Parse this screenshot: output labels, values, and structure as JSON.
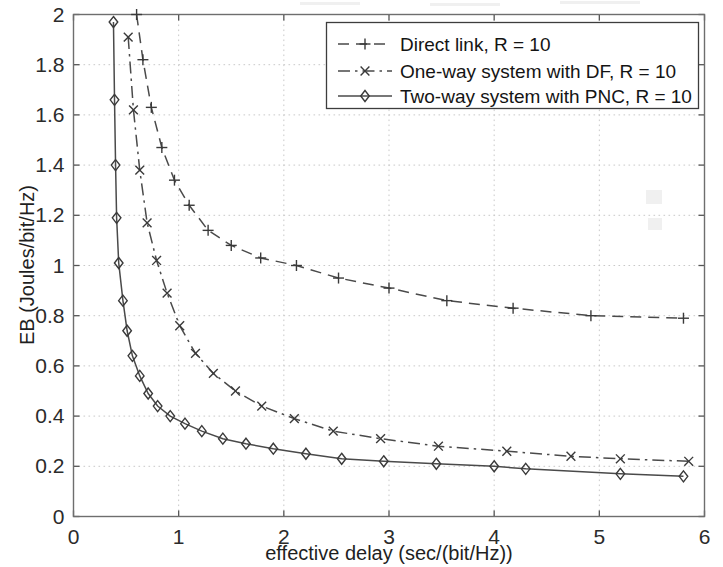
{
  "chart_data": {
    "type": "line",
    "title": "",
    "xlabel": "effective delay (sec/(bit/Hz))",
    "ylabel": "EB (Joules/bit/Hz)",
    "xlim": [
      0,
      6
    ],
    "ylim": [
      0,
      2
    ],
    "xticks": [
      "0",
      "1",
      "2",
      "3",
      "4",
      "5",
      "6"
    ],
    "yticks": [
      "0",
      "0.2",
      "0.4",
      "0.6",
      "0.8",
      "1",
      "1.2",
      "1.4",
      "1.6",
      "1.8",
      "2"
    ],
    "grid": true,
    "legend_position": "top-right",
    "series": [
      {
        "name": "Direct link, R = 10",
        "marker": "plus",
        "linestyle": "dashed",
        "color": "#4a4a4a",
        "points": [
          [
            0.6,
            2.0
          ],
          [
            0.66,
            1.82
          ],
          [
            0.74,
            1.63
          ],
          [
            0.84,
            1.47
          ],
          [
            0.96,
            1.34
          ],
          [
            1.1,
            1.24
          ],
          [
            1.28,
            1.14
          ],
          [
            1.5,
            1.08
          ],
          [
            1.78,
            1.03
          ],
          [
            2.12,
            1.0
          ],
          [
            2.52,
            0.95
          ],
          [
            3.0,
            0.91
          ],
          [
            3.55,
            0.86
          ],
          [
            4.18,
            0.83
          ],
          [
            4.92,
            0.8
          ],
          [
            5.8,
            0.79
          ]
        ]
      },
      {
        "name": "One-way system with DF, R = 10",
        "marker": "x",
        "linestyle": "dashdot",
        "color": "#4a4a4a",
        "points": [
          [
            0.52,
            1.91
          ],
          [
            0.57,
            1.62
          ],
          [
            0.63,
            1.38
          ],
          [
            0.7,
            1.17
          ],
          [
            0.79,
            1.02
          ],
          [
            0.89,
            0.89
          ],
          [
            1.01,
            0.76
          ],
          [
            1.16,
            0.65
          ],
          [
            1.33,
            0.57
          ],
          [
            1.54,
            0.5
          ],
          [
            1.79,
            0.44
          ],
          [
            2.1,
            0.39
          ],
          [
            2.47,
            0.34
          ],
          [
            2.92,
            0.31
          ],
          [
            3.47,
            0.28
          ],
          [
            4.12,
            0.26
          ],
          [
            4.73,
            0.24
          ],
          [
            5.2,
            0.23
          ],
          [
            5.85,
            0.22
          ]
        ]
      },
      {
        "name": "Two-way system with PNC, R = 10",
        "marker": "diamond",
        "linestyle": "solid",
        "color": "#4a4a4a",
        "points": [
          [
            0.38,
            1.97
          ],
          [
            0.39,
            1.66
          ],
          [
            0.4,
            1.4
          ],
          [
            0.41,
            1.19
          ],
          [
            0.43,
            1.01
          ],
          [
            0.47,
            0.86
          ],
          [
            0.51,
            0.74
          ],
          [
            0.56,
            0.64
          ],
          [
            0.63,
            0.56
          ],
          [
            0.71,
            0.49
          ],
          [
            0.8,
            0.44
          ],
          [
            0.92,
            0.4
          ],
          [
            1.06,
            0.37
          ],
          [
            1.22,
            0.34
          ],
          [
            1.42,
            0.31
          ],
          [
            1.64,
            0.29
          ],
          [
            1.9,
            0.27
          ],
          [
            2.21,
            0.25
          ],
          [
            2.55,
            0.23
          ],
          [
            2.95,
            0.22
          ],
          [
            3.45,
            0.21
          ],
          [
            4.0,
            0.2
          ],
          [
            4.3,
            0.19
          ],
          [
            5.2,
            0.17
          ],
          [
            5.8,
            0.16
          ]
        ]
      }
    ]
  },
  "legend": {
    "entries": [
      {
        "label": "Direct link, R = 10"
      },
      {
        "label": "One-way system with DF, R = 10"
      },
      {
        "label": "Two-way system with PNC, R = 10"
      }
    ]
  }
}
